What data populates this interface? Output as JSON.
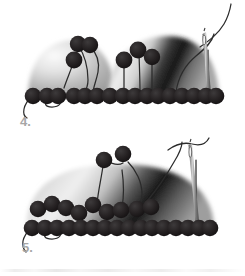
{
  "diagram": {
    "type": "instructional-illustration",
    "style": "grayscale line and gradient drawing",
    "background_color": "#ffffff",
    "bead_color": "#231f20",
    "thread_color": "#2b2b2b",
    "needle_color": "#6f6f6f",
    "label_color": "#a6a6a6",
    "dome_light": "#f2f2f2",
    "dome_mid": "#9a9a9a",
    "dome_dark": "#1c1c1c"
  },
  "steps": [
    {
      "id": "step-4",
      "label": "4.",
      "description": "Two overlapping domed shapes with a base row of beads, three raised beads on threads, and a threaded needle at the right",
      "base_row_bead_count": 17,
      "raised_bead_count": 6,
      "needle": "present",
      "thread_tail": "left"
    },
    {
      "id": "step-5",
      "label": "5.",
      "description": "A single wide domed shape with a base row of beads, a partial second row of beads on the left, two raised beads on threads, and a threaded needle near the right",
      "base_row_bead_count": 19,
      "second_row_bead_count": 9,
      "raised_bead_count": 2,
      "needle": "present",
      "thread_tail": "left"
    }
  ],
  "artifact": {
    "bottom_scan_line": "faint horizontal scan smudge"
  }
}
